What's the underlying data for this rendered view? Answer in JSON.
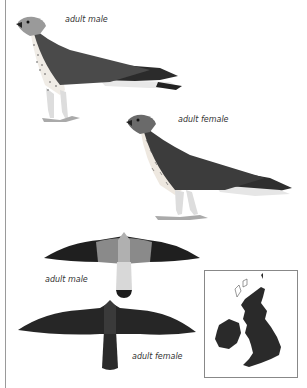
{
  "plate": {
    "figures": [
      {
        "id": "perched-male",
        "label": "adult male"
      },
      {
        "id": "perched-female",
        "label": "adult female"
      },
      {
        "id": "flight-male",
        "label": "adult male"
      },
      {
        "id": "flight-female",
        "label": "adult female"
      }
    ],
    "map": {
      "region": "British Isles distribution map"
    }
  },
  "colors": {
    "plumage_dark": "#2b2b2b",
    "plumage_mid": "#5a5a5a",
    "plumage_light": "#9a9a9a",
    "breast": "#f0ece6",
    "map_land": "#2a2a2a",
    "border": "#888888"
  }
}
